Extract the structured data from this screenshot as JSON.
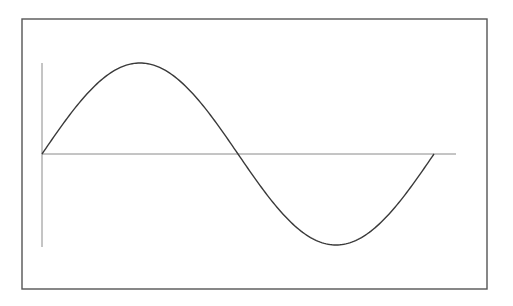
{
  "chart_data": {
    "type": "line",
    "title": "",
    "xlabel": "",
    "ylabel": "",
    "grid": false,
    "legend": null,
    "series": [
      {
        "name": "sine",
        "function": "y = sin(x)",
        "x_range": [
          0,
          6.283185
        ],
        "x": [
          0,
          0.785,
          1.571,
          2.356,
          3.142,
          3.927,
          4.712,
          5.498,
          6.283
        ],
        "values": [
          0,
          0.707,
          1,
          0.707,
          0,
          -0.707,
          -1,
          -0.707,
          0
        ]
      }
    ],
    "xlim": [
      0,
      6.8
    ],
    "ylim": [
      -1,
      1
    ],
    "colors": {
      "frame": "#555555",
      "axis": "#8a8a8a",
      "curve": "#3a3a3a",
      "background": "#ffffff"
    }
  },
  "layout": {
    "frame": {
      "x": 22,
      "y": 19,
      "w": 465,
      "h": 270
    },
    "origin": {
      "x": 42,
      "y": 154
    },
    "x_axis_end": 456,
    "y_axis_top": 63,
    "y_axis_bottom": 247,
    "period_px": 392,
    "amplitude_px": 91
  }
}
